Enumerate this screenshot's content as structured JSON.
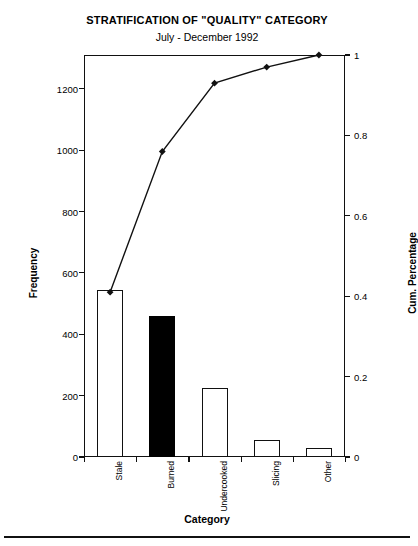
{
  "chart_data": {
    "type": "bar",
    "title": "STRATIFICATION OF \"QUALITY\" CATEGORY",
    "subtitle": "July - December 1992",
    "xlabel": "Category",
    "ylabel": "Frequency",
    "y2label": "Cum. Percentage",
    "categories": [
      "Stale",
      "Burned",
      "Undercooked",
      "Slicing",
      "Other"
    ],
    "values": [
      545,
      460,
      225,
      55,
      30
    ],
    "bar_styles": [
      "open",
      "filled",
      "open",
      "open",
      "open"
    ],
    "cumulative": [
      0.41,
      0.76,
      0.93,
      0.97,
      1.0
    ],
    "ylim": [
      0,
      1310
    ],
    "y2lim": [
      0,
      1.0
    ],
    "yticks": [
      0,
      200,
      400,
      600,
      800,
      1000,
      1200
    ],
    "ytick_labels": [
      "0",
      "200",
      "400",
      "600",
      "800",
      "1000",
      "1200"
    ],
    "y2ticks": [
      0,
      0.2,
      0.4,
      0.6,
      0.8,
      1
    ],
    "y2tick_labels": [
      "0",
      "0.2",
      "0.4",
      "0.6",
      "0.8",
      "1"
    ],
    "grid": false,
    "legend": "none",
    "series": [
      {
        "name": "Frequency",
        "type": "bar",
        "values": [
          545,
          460,
          225,
          55,
          30
        ]
      },
      {
        "name": "Cum. Percentage",
        "type": "line",
        "values": [
          0.41,
          0.76,
          0.93,
          0.97,
          1.0
        ]
      }
    ],
    "colors": {
      "bar_outline": "#111111",
      "bar_fill_open": "#ffffff",
      "bar_fill_highlight": "#000000",
      "line": "#111111",
      "axis": "#111111"
    }
  }
}
